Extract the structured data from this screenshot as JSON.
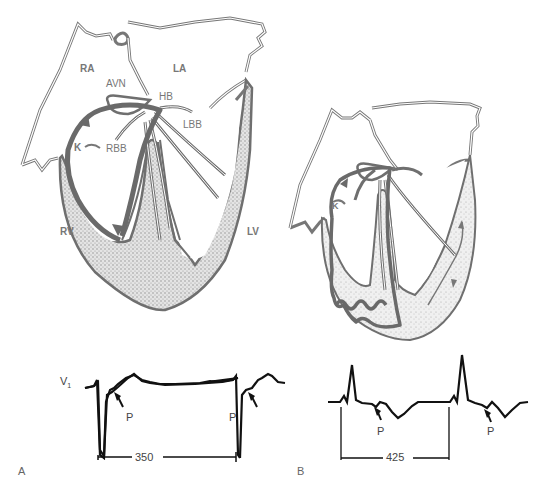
{
  "figure": {
    "panels": [
      {
        "id": "A",
        "letter": "A",
        "heart_labels": {
          "ra": "RA",
          "la": "LA",
          "avn": "AVN",
          "hb": "HB",
          "lbb": "LBB",
          "rbb": "RBB",
          "k": "K",
          "rv": "RV",
          "lv": "LV"
        },
        "ecg": {
          "lead": "V",
          "lead_sub": "1",
          "p_labels": [
            "P",
            "P"
          ],
          "interval": "350"
        }
      },
      {
        "id": "B",
        "letter": "B",
        "heart_labels": {
          "k": "K"
        },
        "ecg": {
          "p_labels": [
            "P",
            "P"
          ],
          "interval": "425"
        }
      }
    ],
    "colors": {
      "line": "#6f6f6f",
      "pathway": "#707070",
      "myocardium_fill": "#cfcfcf",
      "ecg_trace": "#111111",
      "background": "#ffffff"
    }
  }
}
